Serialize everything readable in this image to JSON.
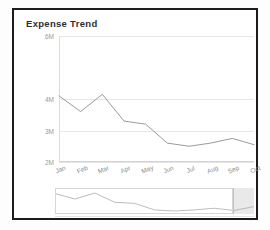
{
  "card": {
    "title": "Expense Trend"
  },
  "chart_data": {
    "type": "line",
    "title": "Expense Trend",
    "xlabel": "",
    "ylabel": "",
    "categories": [
      "Jan",
      "Feb",
      "Mar",
      "Apr",
      "May",
      "Jun",
      "Jul",
      "Aug",
      "Sep",
      "Oct"
    ],
    "values": [
      4.1,
      3.6,
      4.15,
      3.3,
      3.2,
      2.6,
      2.5,
      2.6,
      2.75,
      2.55
    ],
    "series": [
      {
        "name": "Expense",
        "values": [
          4.1,
          3.6,
          4.15,
          3.3,
          3.2,
          2.6,
          2.5,
          2.6,
          2.75,
          2.55
        ]
      }
    ],
    "ytick_labels": [
      "6M",
      "4M",
      "3M",
      "2M"
    ],
    "ytick_values": [
      6,
      4,
      3,
      2
    ],
    "ylim": [
      2,
      6
    ],
    "grid": true,
    "legend": false,
    "line_color": "#9b9b9b",
    "grid_color": "#e6e6e6"
  },
  "navigator": {
    "name": "range-navigator",
    "selection_start_percent": 0,
    "selection_end_percent": 89.5,
    "values": [
      4.1,
      3.6,
      4.15,
      3.3,
      3.2,
      2.6,
      2.5,
      2.6,
      2.75,
      2.55,
      2.9
    ]
  }
}
